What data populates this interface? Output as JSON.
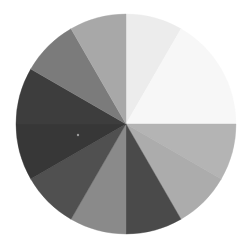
{
  "chart_data": {
    "type": "pie",
    "title": "",
    "start_angle_deg": 0,
    "direction": "clockwise",
    "center": [
      126,
      124
    ],
    "radius": 110,
    "legend": "none",
    "labels": [
      "Slice 1",
      "Slice 2",
      "Slice 3",
      "Slice 4",
      "Slice 5",
      "Slice 6",
      "Slice 7",
      "Slice 8",
      "Slice 9",
      "Slice 10",
      "Slice 11"
    ],
    "values": [
      30,
      60,
      30,
      30,
      30,
      30,
      30,
      30,
      30,
      30,
      30
    ],
    "colors": [
      "#ececec",
      "#f7f7f7",
      "#b4b4b4",
      "#acacac",
      "#4a4a4a",
      "#8a8a8a",
      "#505050",
      "#373737",
      "#3d3d3d",
      "#7b7b7b",
      "#a8a8a8"
    ]
  },
  "marker": {
    "x": 78,
    "y": 135,
    "color": "#9a9a9a"
  }
}
